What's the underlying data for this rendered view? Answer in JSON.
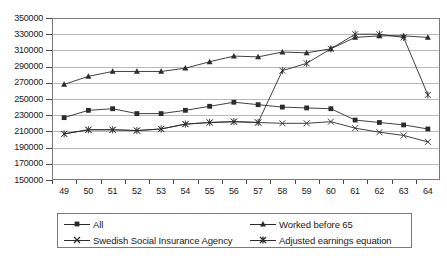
{
  "chart_data": {
    "type": "line",
    "title": "",
    "subtitle": "",
    "xlabel": "",
    "ylabel": "",
    "grid": true,
    "legend_position": "bottom",
    "ylim": [
      150000,
      350000
    ],
    "ytick_step": 20000,
    "yticks": [
      "350000",
      "330000",
      "310000",
      "290000",
      "270000",
      "250000",
      "230000",
      "210000",
      "190000",
      "170000",
      "150000"
    ],
    "categories": [
      "49",
      "50",
      "51",
      "52",
      "53",
      "54",
      "55",
      "56",
      "57",
      "58",
      "59",
      "60",
      "61",
      "62",
      "63",
      "64"
    ],
    "series": [
      {
        "name": "All",
        "marker": "square",
        "color": "#2b2b2b",
        "values": [
          227000,
          236000,
          238000,
          232000,
          232000,
          236000,
          241000,
          246000,
          243000,
          240000,
          239000,
          238000,
          224000,
          221000,
          218000,
          213000
        ]
      },
      {
        "name": "Worked before 65",
        "marker": "triangle",
        "color": "#2b2b2b",
        "values": [
          268000,
          278000,
          284000,
          284000,
          284000,
          288000,
          296000,
          303000,
          302000,
          308000,
          307000,
          312000,
          326000,
          328000,
          328000,
          326000
        ]
      },
      {
        "name": "Swedish Social Insurance Agency",
        "marker": "cross",
        "color": "#2b2b2b",
        "values": [
          207000,
          212000,
          212000,
          211000,
          213000,
          219000,
          221000,
          222000,
          221000,
          220000,
          220000,
          222000,
          214000,
          209000,
          205000,
          197000
        ]
      },
      {
        "name": "Adjusted earnings equation",
        "marker": "asterisk",
        "color": "#2b2b2b",
        "values": [
          207000,
          212000,
          212000,
          211000,
          213000,
          219000,
          221000,
          222000,
          221000,
          285000,
          294000,
          312000,
          330000,
          330000,
          326000,
          255000
        ]
      }
    ]
  },
  "legend": {
    "items": [
      {
        "label": "All",
        "marker": "square"
      },
      {
        "label": "Worked before 65",
        "marker": "triangle"
      },
      {
        "label": "Swedish Social Insurance Agency",
        "marker": "cross"
      },
      {
        "label": "Adjusted earnings equation",
        "marker": "asterisk"
      }
    ]
  }
}
